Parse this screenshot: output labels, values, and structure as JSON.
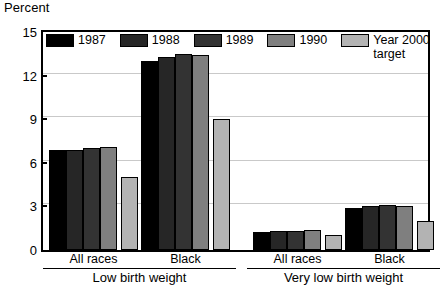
{
  "chart_data": {
    "type": "bar",
    "title": "",
    "ylabel": "Percent",
    "xlabel": "",
    "ylim": [
      0,
      15
    ],
    "yticks": [
      0,
      3,
      6,
      9,
      12,
      15
    ],
    "grid": true,
    "legend_position": "top-inside",
    "sections": [
      {
        "name": "Low birth weight",
        "categories": [
          "All races",
          "Black"
        ]
      },
      {
        "name": "Very low birth weight",
        "categories": [
          "All races",
          "Black"
        ]
      }
    ],
    "categories": [
      "Low birth weight - All races",
      "Low birth weight - Black",
      "Very low birth weight - All races",
      "Very low birth weight - Black"
    ],
    "series": [
      {
        "name": "1987",
        "color": "#000000",
        "values": [
          6.9,
          13.0,
          1.25,
          2.9
        ]
      },
      {
        "name": "1988",
        "color": "#262626",
        "values": [
          6.9,
          13.3,
          1.3,
          3.0
        ]
      },
      {
        "name": "1989",
        "color": "#333333",
        "values": [
          7.0,
          13.5,
          1.3,
          3.1
        ]
      },
      {
        "name": "1990",
        "color": "#7f7f7f",
        "values": [
          7.1,
          13.4,
          1.35,
          3.0
        ]
      },
      {
        "name": "Year 2000\ntarget",
        "color": "#b3b3b3",
        "values": [
          5.0,
          9.0,
          1.0,
          2.0
        ]
      }
    ]
  },
  "axis": {
    "y_title": "Percent",
    "y_tick_labels": [
      "15",
      "12",
      "9",
      "6",
      "3",
      "0"
    ]
  },
  "legend": {
    "items": [
      {
        "label": "1987",
        "color": "#000000"
      },
      {
        "label": "1988",
        "color": "#262626"
      },
      {
        "label": "1989",
        "color": "#333333"
      },
      {
        "label": "1990",
        "color": "#7f7f7f"
      },
      {
        "label": "Year 2000\ntarget",
        "color": "#b3b3b3"
      }
    ]
  },
  "colors": {
    "axis": "#000000",
    "grid": "#c9c9c9",
    "background": "#ffffff"
  }
}
